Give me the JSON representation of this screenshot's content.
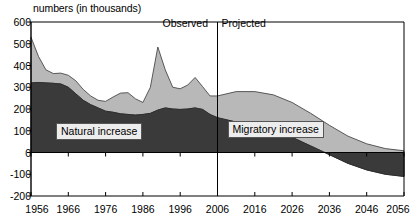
{
  "chart_data": {
    "type": "area",
    "title": "numbers (in thousands)",
    "xlabel": "",
    "ylabel": "numbers (in thousands)",
    "stacked": true,
    "grid": false,
    "legend_position": "inline-annotation",
    "xlim": [
      1956,
      2056
    ],
    "ylim": [
      -200,
      600
    ],
    "ytick_labels": [
      "600",
      "500",
      "400",
      "300",
      "200",
      "100",
      "0",
      "-100",
      "-200"
    ],
    "ytick_values": [
      600,
      500,
      400,
      300,
      200,
      100,
      0,
      -100,
      -200
    ],
    "xtick_labels": [
      "1956",
      "1966",
      "1976",
      "1986",
      "1996",
      "2006",
      "2016",
      "2026",
      "2036",
      "2046",
      "2056"
    ],
    "xtick_values": [
      1956,
      1966,
      1976,
      1986,
      1996,
      2006,
      2016,
      2026,
      2036,
      2046,
      2056
    ],
    "divider_year": 2006,
    "annotations": [
      {
        "name": "observed",
        "text": "Observed",
        "x": 2000
      },
      {
        "name": "projected",
        "text": "Projected",
        "x": 2012
      }
    ],
    "series": [
      {
        "name": "Natural increase",
        "color": "#3a3a3a",
        "x": [
          1956,
          1958,
          1960,
          1962,
          1964,
          1966,
          1968,
          1970,
          1972,
          1974,
          1976,
          1978,
          1980,
          1982,
          1984,
          1986,
          1988,
          1990,
          1992,
          1994,
          1996,
          1998,
          2000,
          2002,
          2004,
          2006,
          2011,
          2016,
          2021,
          2026,
          2031,
          2036,
          2041,
          2046,
          2051,
          2056
        ],
        "values": [
          320,
          322,
          320,
          318,
          315,
          300,
          270,
          240,
          220,
          205,
          190,
          185,
          178,
          175,
          172,
          175,
          180,
          195,
          205,
          200,
          198,
          200,
          205,
          198,
          175,
          160,
          140,
          120,
          100,
          70,
          30,
          -10,
          -50,
          -80,
          -100,
          -110
        ]
      },
      {
        "name": "Migratory increase",
        "color": "#b8b8b8",
        "x": [
          1956,
          1958,
          1960,
          1962,
          1964,
          1966,
          1968,
          1970,
          1972,
          1974,
          1976,
          1978,
          1980,
          1982,
          1984,
          1986,
          1988,
          1990,
          1992,
          1994,
          1996,
          1998,
          2000,
          2002,
          2004,
          2006,
          2011,
          2016,
          2021,
          2026,
          2031,
          2036,
          2041,
          2046,
          2051,
          2056
        ],
        "values": [
          210,
          120,
          60,
          45,
          50,
          55,
          60,
          50,
          40,
          35,
          45,
          70,
          95,
          100,
          75,
          55,
          120,
          290,
          175,
          100,
          95,
          110,
          140,
          105,
          85,
          100,
          140,
          160,
          165,
          160,
          150,
          135,
          125,
          120,
          118,
          118
        ]
      }
    ],
    "totals_note": "Total height of stacked area equals natural increase plus migratory increase"
  },
  "axis": {
    "title": "numbers (in thousands)"
  },
  "labels": {
    "natural": "Natural increase",
    "migratory": "Migratory increase",
    "observed": "Observed",
    "projected": "Projected"
  },
  "colors": {
    "natural": "#3a3a3a",
    "migratory": "#b8b8b8",
    "axis": "#000000",
    "background": "#ffffff",
    "label_box_bg": "#ededed"
  }
}
